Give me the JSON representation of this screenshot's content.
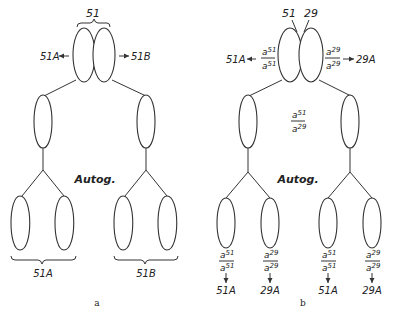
{
  "panels": {
    "a": {
      "caption": "a",
      "top_label": "51",
      "left_arrow_label": "51A",
      "right_arrow_label": "51B",
      "center_label": "Autog.",
      "bottom_left_label": "51A",
      "bottom_right_label": "51B"
    },
    "b": {
      "caption": "b",
      "top_left_label": "51",
      "top_right_label": "29",
      "left_arrow_label": "51A",
      "right_arrow_label": "29A",
      "left_fraction": {
        "num": "a",
        "num_sup": "51",
        "den": "a",
        "den_sup": "51"
      },
      "right_fraction": {
        "num": "a",
        "num_sup": "29",
        "den": "a",
        "den_sup": "29"
      },
      "middle_fraction": {
        "num": "a",
        "num_sup": "51",
        "den": "a",
        "den_sup": "29"
      },
      "center_label": "Autog.",
      "bottom": [
        {
          "num_sup": "51",
          "den_sup": "51",
          "result": "51A"
        },
        {
          "num_sup": "29",
          "den_sup": "29",
          "result": "29A"
        },
        {
          "num_sup": "51",
          "den_sup": "51",
          "result": "51A"
        },
        {
          "num_sup": "29",
          "den_sup": "29",
          "result": "29A"
        }
      ]
    }
  }
}
